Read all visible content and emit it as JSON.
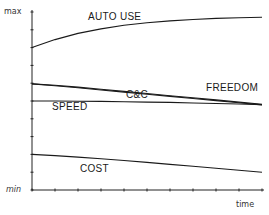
{
  "chart_data": {
    "type": "line",
    "title": "",
    "xlabel": "time",
    "ylabel": "",
    "y_tick_labels": {
      "top": "max",
      "bottom": "min"
    },
    "ylim": [
      0,
      10
    ],
    "xlim": [
      0,
      10
    ],
    "grid": false,
    "legend": "inline labels",
    "x": [
      0,
      1,
      2,
      3,
      4,
      5,
      6,
      7,
      8,
      9,
      10
    ],
    "series": [
      {
        "name": "AUTO USE",
        "values": [
          8.0,
          8.45,
          8.8,
          9.05,
          9.25,
          9.4,
          9.5,
          9.58,
          9.64,
          9.68,
          9.7
        ]
      },
      {
        "name": "FREEDOM",
        "values": [
          5.96,
          5.88,
          5.78,
          5.66,
          5.54,
          5.42,
          5.3,
          5.18,
          5.06,
          4.94,
          4.82
        ]
      },
      {
        "name": "C&C",
        "values": [
          5.96,
          5.86,
          5.74,
          5.62,
          5.5,
          5.38,
          5.26,
          5.14,
          5.02,
          4.9,
          4.78
        ]
      },
      {
        "name": "SPEED",
        "values": [
          5.0,
          5.0,
          4.99,
          4.98,
          4.96,
          4.94,
          4.92,
          4.89,
          4.86,
          4.83,
          4.8
        ]
      },
      {
        "name": "COST",
        "values": [
          2.0,
          1.93,
          1.85,
          1.76,
          1.66,
          1.55,
          1.44,
          1.33,
          1.22,
          1.11,
          1.0
        ]
      }
    ],
    "label_positions": {
      "AUTO USE": {
        "x": 88,
        "y": 11
      },
      "FREEDOM": {
        "x": 206,
        "y": 82
      },
      "C&C": {
        "x": 126,
        "y": 89
      },
      "SPEED": {
        "x": 52,
        "y": 101
      },
      "COST": {
        "x": 80,
        "y": 163
      }
    }
  },
  "colors": {
    "line": "#1a1a1a",
    "axis": "#222222",
    "background": "#ffffff"
  }
}
